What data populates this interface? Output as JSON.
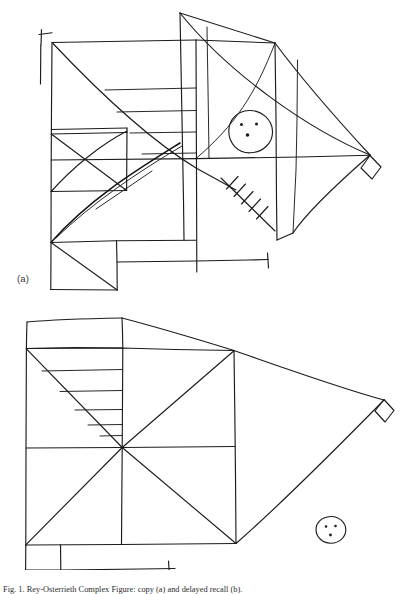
{
  "document": {
    "background_color": "#ffffff",
    "ink_color": "#1c1c1c",
    "width": 411,
    "height": 594,
    "caption": "Fig. 1. Rey-Osterrieth Complex Figure: copy (a) and delayed recall (b)."
  },
  "figure": {
    "panels": [
      {
        "id": "a",
        "label": "(a)",
        "description": "Hand-drawn copy of the Rey-Osterrieth Complex Figure. Large rectangle divided by horizontal and vertical midlines and both diagonals, with a triangle attached on the right terminating in a small diamond, a small cross at upper left, a cross-hatched box at lower left, a circle with three dots in the upper right quadrant, a hatched oblique line in the lower right quadrant, and a horizontal bar with a terminal tick at the bottom.",
        "elements": [
          {
            "name": "outer-rectangle",
            "present": true
          },
          {
            "name": "left-cross-tick",
            "present": true
          },
          {
            "name": "horizontal-midline",
            "present": true
          },
          {
            "name": "vertical-midline",
            "present": true
          },
          {
            "name": "diagonal-major",
            "present": true
          },
          {
            "name": "diagonal-minor",
            "present": true
          },
          {
            "name": "small-crossed-square-lower-left",
            "present": true
          },
          {
            "name": "horizontal-parallel-lines-upper-left",
            "count": 4
          },
          {
            "name": "right-triangle-apex",
            "present": true
          },
          {
            "name": "diamond-at-apex",
            "present": true
          },
          {
            "name": "circle-with-three-dots",
            "dots": 3
          },
          {
            "name": "hatched-oblique-line",
            "hatch_count": 5
          },
          {
            "name": "bottom-bar-with-tick",
            "present": true
          },
          {
            "name": "bottom-left-rectangle-with-diagonal",
            "present": true
          }
        ]
      },
      {
        "id": "b",
        "label": "(b)",
        "description": "Delayed-recall reproduction of the same figure. Simplified rectangle with both diagonals and midlines meeting at a common centre, horizontal parallel lines filling the upper-left triangle, a right-hand triangle ending in a small diamond, a detached circle with three dots at lower right, and a bottom bar with a single tick.",
        "elements": [
          {
            "name": "outer-rectangle",
            "present": true
          },
          {
            "name": "top-band-rectangle",
            "present": true
          },
          {
            "name": "horizontal-midline",
            "present": true
          },
          {
            "name": "vertical-midline",
            "present": true
          },
          {
            "name": "diagonal-major",
            "present": true
          },
          {
            "name": "diagonal-minor",
            "present": true
          },
          {
            "name": "horizontal-parallel-lines-upper-left",
            "count": 5
          },
          {
            "name": "right-triangle-apex",
            "present": true
          },
          {
            "name": "diamond-at-apex",
            "present": true
          },
          {
            "name": "circle-with-three-dots",
            "dots": 3
          },
          {
            "name": "bottom-bar-with-tick",
            "present": true
          }
        ]
      }
    ]
  }
}
